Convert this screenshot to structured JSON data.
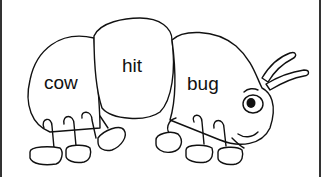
{
  "illustration": {
    "subject": "caterpillar",
    "segments": [
      {
        "label": "cow"
      },
      {
        "label": "hit"
      },
      {
        "label": "bug"
      }
    ],
    "colors": {
      "line": "#111111",
      "fill": "#ffffff",
      "border": "#333333"
    }
  }
}
